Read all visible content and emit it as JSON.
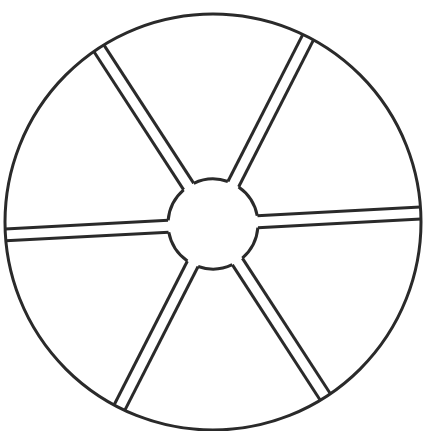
{
  "diagram": {
    "title": "",
    "type": "wheel",
    "rim": {
      "cx": 213,
      "cy": 222,
      "r": 208
    },
    "hub": {
      "cx": 213,
      "cy": 224,
      "r": 45
    },
    "spoke_count": 6,
    "spoke_half_width": 6,
    "spoke_angles_deg": [
      -3,
      57,
      117,
      177,
      237,
      297
    ],
    "stroke_color": "#2a2a2a",
    "background": "#ffffff"
  }
}
